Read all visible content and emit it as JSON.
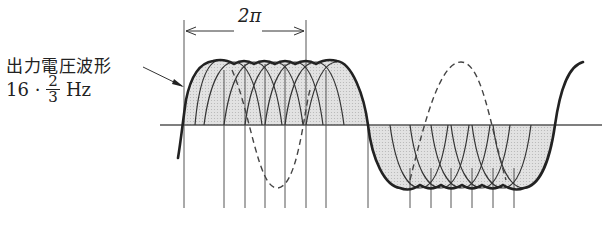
{
  "diagram": {
    "title_label": "出力電圧波形",
    "frequency": {
      "prefix": "16 ·",
      "numerator": "2",
      "denominator": "3",
      "unit": "Hz"
    },
    "dimension_label": "2π",
    "colors": {
      "ink": "#222222",
      "fill": "#d9d9d9",
      "axis": "#555555"
    },
    "elements": [
      "horizontal time axis",
      "positive half-cycle envelope made of overlapping arcs",
      "negative half-cycle envelope made of overlapping arcs",
      "dashed reference sine wave",
      "vertical switching lines",
      "2π dimension arrow",
      "pointer arrow from label to waveform"
    ]
  }
}
